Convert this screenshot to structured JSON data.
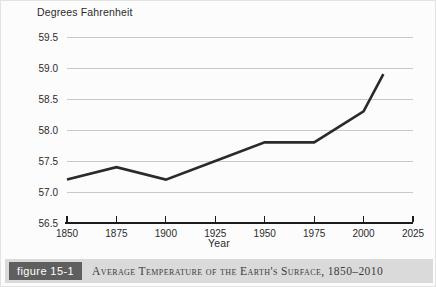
{
  "figure": {
    "badge_label": "figure 15-1",
    "caption": "Average Temperature of the Earth's Surface, 1850–2010"
  },
  "chart_data": {
    "type": "line",
    "title": "Average Temperature of the Earth's Surface, 1850–2010",
    "xlabel": "Year",
    "ylabel": "Degrees Fahrenheit",
    "x": [
      1850,
      1875,
      1900,
      1925,
      1950,
      1975,
      2000,
      2010
    ],
    "values": [
      57.2,
      57.4,
      57.2,
      57.5,
      57.8,
      57.8,
      58.3,
      58.9
    ],
    "series": [
      {
        "name": "Average Temperature of the Earth's Surface",
        "values": [
          57.2,
          57.4,
          57.2,
          57.5,
          57.8,
          57.8,
          58.3,
          58.9
        ]
      }
    ],
    "xlim": [
      1850,
      2025
    ],
    "ylim": [
      56.5,
      59.5
    ],
    "xticks": [
      1850,
      1875,
      1900,
      1925,
      1950,
      1975,
      2000,
      2025
    ],
    "xtick_labels": [
      "1850",
      "1875",
      "1900",
      "1925",
      "1950",
      "1975",
      "2000",
      "2025"
    ],
    "yticks": [
      56.5,
      57.0,
      57.5,
      58.0,
      58.5,
      59.0,
      59.5
    ],
    "ytick_labels": [
      "56.5",
      "57.0",
      "57.5",
      "58.0",
      "58.5",
      "59.0",
      "59.5"
    ],
    "grid": true,
    "grid_axis": "y",
    "legend": false,
    "line_color": "#2a2a2a",
    "grid_color": "#c9c9c9",
    "axis_color": "#1c1c1c"
  }
}
